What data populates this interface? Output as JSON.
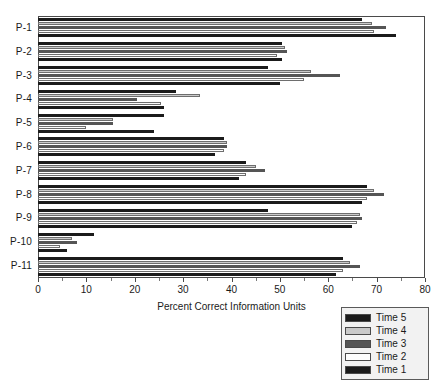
{
  "chart_data": {
    "type": "bar",
    "orientation": "horizontal",
    "title": "",
    "xlabel": "Percent Correct Information Units",
    "ylabel": "",
    "xlim": [
      0,
      80
    ],
    "xticks": [
      0,
      10,
      20,
      30,
      40,
      50,
      60,
      70,
      80
    ],
    "xtick_labels": [
      "0",
      "10",
      "20",
      "30",
      "40",
      "50",
      "60",
      "70",
      "80"
    ],
    "grid": false,
    "legend_position": "below-right",
    "categories": [
      "P-1",
      "P-2",
      "P-3",
      "P-4",
      "P-5",
      "P-6",
      "P-7",
      "P-8",
      "P-9",
      "P-10",
      "P-11"
    ],
    "series": [
      {
        "name": "Time 5",
        "color": "#1b1b1b",
        "values": [
          67.0,
          50.5,
          47.5,
          28.5,
          26.0,
          38.5,
          43.0,
          68.0,
          47.5,
          11.5,
          63.0
        ]
      },
      {
        "name": "Time 4",
        "color": "#c9c9c9",
        "values": [
          69.0,
          51.0,
          56.5,
          33.5,
          15.5,
          39.0,
          45.0,
          69.5,
          66.5,
          7.0,
          64.5
        ]
      },
      {
        "name": "Time 3",
        "color": "#555555",
        "values": [
          72.0,
          51.5,
          62.5,
          20.5,
          15.5,
          39.0,
          47.0,
          71.5,
          67.0,
          8.0,
          66.5
        ]
      },
      {
        "name": "Time 2",
        "color": "#fdfdfd",
        "values": [
          69.5,
          49.5,
          55.0,
          25.5,
          10.0,
          38.5,
          43.0,
          68.0,
          66.0,
          4.5,
          63.0
        ]
      },
      {
        "name": "Time 1",
        "color": "#1b1b1b",
        "values": [
          74.0,
          50.5,
          50.0,
          26.0,
          24.0,
          36.5,
          41.5,
          67.0,
          65.0,
          6.0,
          61.5
        ]
      }
    ]
  },
  "legend": {
    "entries": [
      {
        "label": "Time 5",
        "swatch": "t5"
      },
      {
        "label": "Time 4",
        "swatch": "t4"
      },
      {
        "label": "Time 3",
        "swatch": "t3"
      },
      {
        "label": "Time 2",
        "swatch": "t2"
      },
      {
        "label": "Time 1",
        "swatch": "t1"
      }
    ]
  }
}
